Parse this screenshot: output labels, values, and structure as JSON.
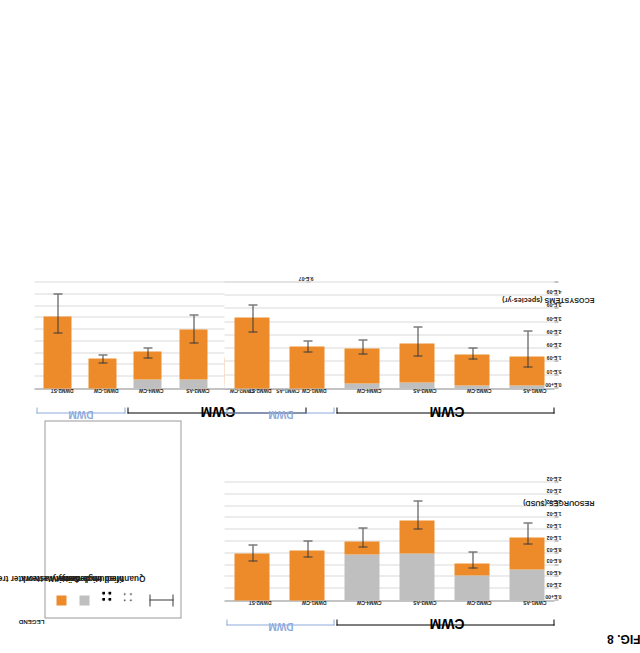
{
  "figure": {
    "label": "FIG. 8"
  },
  "legend": {
    "title": "LEGEND",
    "items": [
      {
        "label": "Wastewater treatment (WWT)",
        "swatch": "wwt",
        "color": "#ED8B2B"
      },
      {
        "label": "Sewer network",
        "swatch": "sewer",
        "color": "#BFBFBF"
      },
      {
        "label": "High density",
        "swatch": "pattern-high-density"
      },
      {
        "label": "Medium density",
        "swatch": "pattern-medium-density"
      },
      {
        "label": "Quantified uncertainty",
        "swatch": "error-bar"
      }
    ]
  },
  "groups": [
    {
      "name": "CWM",
      "color": "#000000",
      "members": [
        "CWM1-AS",
        "CWM2-CW",
        "CWM3-AS",
        "CWM4-CW"
      ]
    },
    {
      "name": "DWM",
      "color": "#8FAADC",
      "members": [
        "DWM1-CW",
        "DWM2-ST"
      ]
    }
  ],
  "chart_data": [
    {
      "id": "human-health",
      "type": "bar",
      "title": "",
      "ylabel": "HUMAN HEALTH (DALY)",
      "xlabel": "",
      "orientation": "vertical",
      "ylim": [
        0,
        9e-07
      ],
      "yticks": [
        0,
        1e-07,
        2e-07,
        3e-07,
        4e-07,
        5e-07,
        6e-07,
        7e-07,
        8e-07,
        9e-07
      ],
      "ytick_labels": [
        "0.E+00",
        "1.E-07",
        "2.E-07",
        "3.E-07",
        "4.E-07",
        "5.E-07",
        "6.E-07",
        "7.E-07",
        "8.E-07",
        "9.E-07"
      ],
      "grid": true,
      "categories": [
        "CWM1-AS",
        "CWM2-CW",
        "CWM3-AS",
        "CWM4-CW",
        "DWM1-CW",
        "DWM2-ST"
      ],
      "series": [
        {
          "name": "Sewer network",
          "color": "#BFBFBF",
          "pattern": [
            "medium",
            "medium",
            "high",
            "high",
            null,
            null
          ],
          "values": [
            4.5e-08,
            4e-08,
            8e-08,
            7.5e-08,
            0,
            0
          ]
        },
        {
          "name": "Wastewater treatment (WWT)",
          "color": "#ED8B2B",
          "values": [
            3.55e-07,
            2.25e-07,
            4.2e-07,
            2.35e-07,
            2.55e-07,
            6.1e-07
          ]
        }
      ],
      "totals": [
        4e-07,
        2.65e-07,
        5e-07,
        3.1e-07,
        2.55e-07,
        6.1e-07
      ],
      "errors": [
        {
          "low": 2.75e-07,
          "high": 5.1e-07
        },
        {
          "low": 2.25e-07,
          "high": 2.9e-07
        },
        {
          "low": 3.85e-07,
          "high": 6.2e-07
        },
        {
          "low": 2.55e-07,
          "high": 3.4e-07
        },
        {
          "low": 2.15e-07,
          "high": 2.8e-07
        },
        {
          "low": 4.7e-07,
          "high": 8e-07
        }
      ]
    },
    {
      "id": "resources",
      "type": "bar",
      "title": "",
      "ylabel": "RESOURCES ($USD)",
      "xlabel": "",
      "orientation": "vertical",
      "ylim": [
        0,
        0.02
      ],
      "yticks": [
        0,
        0.002,
        0.004,
        0.006,
        0.008,
        0.01,
        0.012,
        0.014,
        0.016,
        0.018,
        0.02
      ],
      "ytick_labels": [
        "0.E+00",
        "2.E-03",
        "4.E-03",
        "6.E-03",
        "8.E-03",
        "1.E-02",
        "1.E-02",
        "1.E-02",
        "2.E-02",
        "2.E-02",
        "2.E-02"
      ],
      "grid": true,
      "categories": [
        "CWM1-AS",
        "CWM2-CW",
        "CWM3-AS",
        "CWM4-CW",
        "DWM1-CW",
        "DWM2-ST"
      ],
      "series": [
        {
          "name": "Sewer network",
          "color": "#BFBFBF",
          "pattern": [
            "medium",
            "medium",
            "high",
            "high",
            null,
            null
          ],
          "values": [
            0.0052,
            0.0043,
            0.008,
            0.0078,
            0,
            0
          ]
        },
        {
          "name": "Wastewater treatment (WWT)",
          "color": "#ED8B2B",
          "values": [
            0.0055,
            0.0019,
            0.0055,
            0.0022,
            0.0085,
            0.008
          ]
        }
      ],
      "totals": [
        0.0107,
        0.0062,
        0.0135,
        0.01,
        0.0085,
        0.008
      ],
      "errors": [
        {
          "low": 0.0095,
          "high": 0.013
        },
        {
          "low": 0.0055,
          "high": 0.0082
        },
        {
          "low": 0.012,
          "high": 0.0168
        },
        {
          "low": 0.009,
          "high": 0.0122
        },
        {
          "low": 0.0073,
          "high": 0.01
        },
        {
          "low": 0.0066,
          "high": 0.0094
        }
      ]
    },
    {
      "id": "ecosystems",
      "type": "bar",
      "title": "",
      "ylabel": "ECOSYSTEMS (species·yr)",
      "xlabel": "",
      "orientation": "vertical",
      "ylim": [
        0,
        4e-09
      ],
      "yticks": [
        0,
        5e-10,
        1e-09,
        1.5e-09,
        2e-09,
        2.5e-09,
        3e-09,
        3.5e-09,
        4e-09
      ],
      "ytick_labels": [
        "0.E+00",
        "5.E-10",
        "1.E-09",
        "2.E-09",
        "2.E-09",
        "3.E-09",
        "3.E-09",
        "4.E-09"
      ],
      "grid": true,
      "categories": [
        "CWM1-AS",
        "CWM2-CW",
        "CWM3-AS",
        "CWM4-CW",
        "DWM1-CW",
        "DWM2-ST"
      ],
      "series": [
        {
          "name": "Sewer network",
          "color": "#BFBFBF",
          "pattern": [
            "medium",
            "medium",
            "high",
            "high",
            null,
            null
          ],
          "values": [
            1.2e-10,
            1e-10,
            2.2e-10,
            2e-10,
            0,
            0
          ]
        },
        {
          "name": "Wastewater treatment (WWT)",
          "color": "#ED8B2B",
          "values": [
            1.08e-09,
            1.2e-09,
            1.48e-09,
            1.3e-09,
            1.58e-09,
            2.68e-09
          ]
        }
      ],
      "totals": [
        1.2e-09,
        1.3e-09,
        1.7e-09,
        1.5e-09,
        1.58e-09,
        2.68e-09
      ],
      "errors": [
        {
          "low": 8e-10,
          "high": 2.15e-09
        },
        {
          "low": 1.08e-09,
          "high": 1.52e-09
        },
        {
          "low": 1.2e-09,
          "high": 2.3e-09
        },
        {
          "low": 1.3e-09,
          "high": 1.8e-09
        },
        {
          "low": 1.35e-09,
          "high": 1.78e-09
        },
        {
          "low": 2.1e-09,
          "high": 3.15e-09
        }
      ]
    }
  ]
}
